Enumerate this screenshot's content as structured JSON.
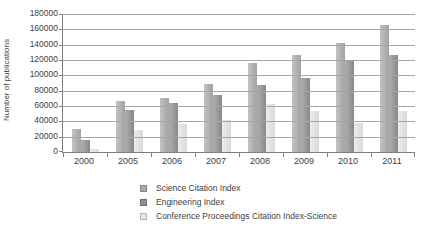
{
  "chart_data": {
    "type": "bar",
    "title": "",
    "xlabel": "",
    "ylabel": "Number of publications",
    "ylim": [
      0,
      180000
    ],
    "y_tick_step": 20000,
    "y_tick_labels": [
      "0",
      "20000",
      "40000",
      "60000",
      "80000",
      "100000",
      "120000",
      "140000",
      "160000",
      "180000"
    ],
    "categories": [
      "2000",
      "2005",
      "2006",
      "2007",
      "2008",
      "2009",
      "2010",
      "2011"
    ],
    "series": [
      {
        "name": "Science Citation Index",
        "color": "#ababab",
        "values": [
          30000,
          67000,
          71000,
          89000,
          116000,
          127000,
          142000,
          165000
        ]
      },
      {
        "name": "Engineering Index",
        "color": "#8f8f8f",
        "values": [
          15000,
          55000,
          64000,
          74000,
          88000,
          97000,
          120000,
          127000
        ]
      },
      {
        "name": "Conference Proceedings Citation Index-Science",
        "color": "#e4e4e4",
        "values": [
          4000,
          29000,
          37000,
          42000,
          62000,
          53000,
          38000,
          53000
        ]
      }
    ],
    "grid": true,
    "legend_position": "bottom"
  }
}
